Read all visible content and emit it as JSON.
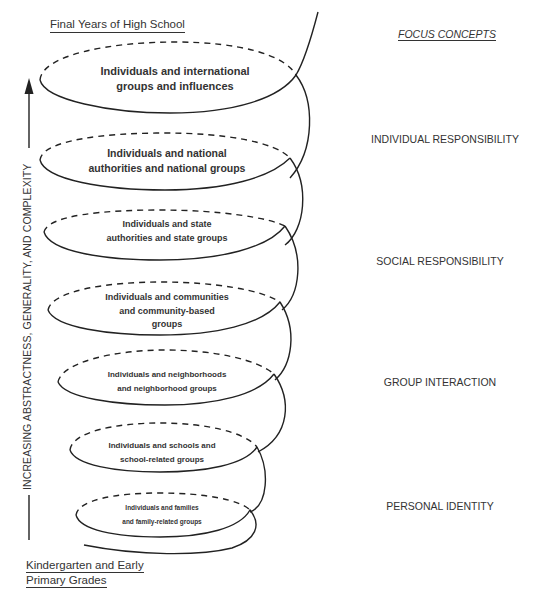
{
  "diagram": {
    "top_label": "Final Years of High School",
    "bottom_label_line1": "Kindergarten and Early",
    "bottom_label_line2": "Primary Grades",
    "axis_label": "INCREASING ABSTRACTNESS, GENERALITY, AND COMPLEXITY",
    "axis_arrow": "up-arrow-icon",
    "focus_concepts": {
      "title": "FOCUS CONCEPTS",
      "items": [
        "INDIVIDUAL RESPONSIBILITY",
        "SOCIAL RESPONSIBILITY",
        "GROUP INTERACTION",
        "PERSONAL IDENTITY"
      ]
    },
    "spiral_loops": [
      {
        "line1": "Individuals and international",
        "line2": "groups and influences",
        "line3": ""
      },
      {
        "line1": "Individuals and national",
        "line2": "authorities and national groups",
        "line3": ""
      },
      {
        "line1": "Individuals and state",
        "line2": "authorities and state groups",
        "line3": ""
      },
      {
        "line1": "Individuals and communities",
        "line2": "and community-based",
        "line3": "groups"
      },
      {
        "line1": "Individuals and neighborhoods",
        "line2": "and neighborhood groups",
        "line3": ""
      },
      {
        "line1": "Individuals and schools and",
        "line2": "school-related groups",
        "line3": ""
      },
      {
        "line1": "Individuals and families",
        "line2": "and family-related groups",
        "line3": ""
      }
    ],
    "colors": {
      "line": "#222222",
      "text": "#333333",
      "background": "#ffffff"
    }
  }
}
